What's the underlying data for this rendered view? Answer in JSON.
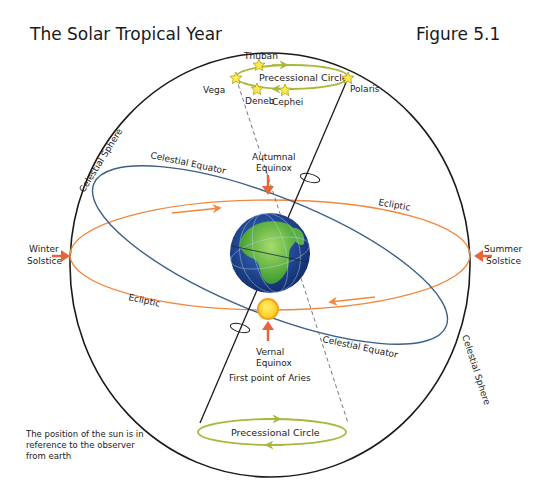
{
  "title": "The Solar Tropical Year",
  "figure_label": "Figure 5.1",
  "colors": {
    "sphere": "#1a1a1a",
    "celestial_equator": "#3b5f86",
    "ecliptic": "#f0883e",
    "precession": "#a8b83a",
    "equinox_arrow": "#e8643c",
    "sun_fill": "#ffd21f",
    "sun_ring": "#f4a21c",
    "earth_ocean": "#1f4a9a",
    "earth_land": "#4aa83a",
    "star_fill": "#ffe94a"
  },
  "labels": {
    "celestial_sphere_top": "Celestial Sphere",
    "celestial_sphere_bottom": "Celestial Sphere",
    "celestial_equator_top": "Celestial Equator",
    "celestial_equator_bottom": "Celestial Equator",
    "ecliptic_right": "Ecliptic",
    "ecliptic_left": "Ecliptic",
    "autumnal_equinox": [
      "Autumnal",
      "Equinox"
    ],
    "vernal_equinox": [
      "Vernal",
      "Equinox"
    ],
    "first_point_of_aries": "First point of Aries",
    "winter_solstice": [
      "Winter",
      "Solstice"
    ],
    "summer_solstice": [
      "Summer",
      "Solstice"
    ],
    "precessional_circle_top": "Precessional Circle",
    "precessional_circle_bottom": "Precessional Circle"
  },
  "stars": [
    {
      "name": "Thuban"
    },
    {
      "name": "Vega"
    },
    {
      "name": "Deneb"
    },
    {
      "name": "Cephei"
    },
    {
      "name": "Polaris"
    }
  ],
  "note": [
    "The position of the sun is in",
    "reference to the observer",
    "from earth"
  ]
}
